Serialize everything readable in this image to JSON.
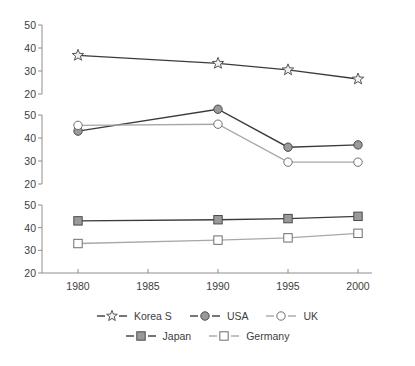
{
  "chart_data": {
    "type": "line",
    "title": "",
    "subtitle": "",
    "xlabel": "",
    "ylabel": "",
    "x": [
      1980,
      1990,
      1995,
      2000
    ],
    "xtick_labels": [
      "1980",
      "1985",
      "1990",
      "1995",
      "2000"
    ],
    "xtick_values": [
      1980,
      1985,
      1990,
      1995,
      2000
    ],
    "xlim": [
      1978,
      2002
    ],
    "ytick_labels": [
      "20",
      "30",
      "40",
      "50"
    ],
    "ytick_values": [
      20,
      30,
      40,
      50
    ],
    "ylim": [
      20,
      50
    ],
    "grid": false,
    "legend_position": "bottom",
    "panels": [
      {
        "name": "panel-top",
        "series": [
          {
            "name": "Korea S",
            "marker": "star-open",
            "marker_fill": "#f2f2f2",
            "marker_stroke": "#555555",
            "line_color": "#3b3b3b",
            "values": [
              36.8,
              33.3,
              30.5,
              26.5
            ]
          }
        ]
      },
      {
        "name": "panel-middle",
        "series": [
          {
            "name": "USA",
            "marker": "circle-filled",
            "marker_fill": "#9a9a9a",
            "marker_stroke": "#4a4a4a",
            "line_color": "#3b3b3b",
            "values": [
              43.0,
              52.5,
              36.0,
              37.0
            ]
          },
          {
            "name": "UK",
            "marker": "circle-open",
            "marker_fill": "#ffffff",
            "marker_stroke": "#6e6e6e",
            "line_color": "#a8a8a8",
            "values": [
              45.5,
              46.0,
              29.5,
              29.5
            ]
          }
        ]
      },
      {
        "name": "panel-bottom",
        "series": [
          {
            "name": "Japan",
            "marker": "square-filled",
            "marker_fill": "#9a9a9a",
            "marker_stroke": "#4a4a4a",
            "line_color": "#3b3b3b",
            "values": [
              43.0,
              43.5,
              44.0,
              45.0
            ]
          },
          {
            "name": "Germany",
            "marker": "square-open",
            "marker_fill": "#ffffff",
            "marker_stroke": "#6e6e6e",
            "line_color": "#a8a8a8",
            "values": [
              33.0,
              34.5,
              35.5,
              37.5
            ]
          }
        ]
      }
    ],
    "legend": [
      {
        "label": "Korea S",
        "marker": "star-open"
      },
      {
        "label": "USA",
        "marker": "circle-filled"
      },
      {
        "label": "UK",
        "marker": "circle-open"
      },
      {
        "label": "Japan",
        "marker": "square-filled"
      },
      {
        "label": "Germany",
        "marker": "square-open"
      }
    ],
    "colors": {
      "axis": "#8e8e8e",
      "text": "#3d3d3d",
      "dark_line": "#3b3b3b",
      "light_line": "#a8a8a8",
      "marker_gray": "#9a9a9a",
      "background": "#ffffff"
    }
  }
}
